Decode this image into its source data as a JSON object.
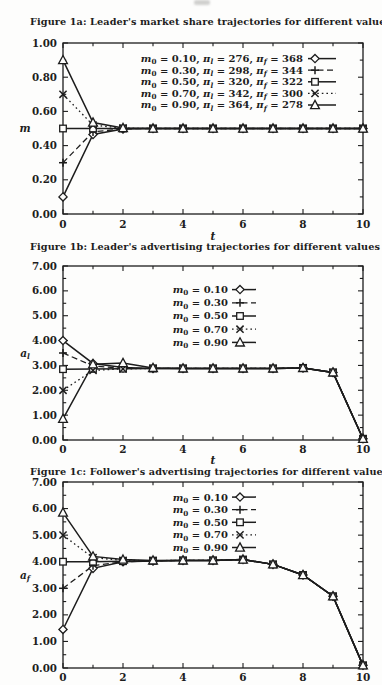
{
  "page": {
    "background": "#fdfdfc",
    "ink": "#1d1d1d",
    "description_markers": {
      "diamond": "open-diamond-marker",
      "plus": "plus-marker",
      "square": "open-square-marker",
      "x": "x-marker",
      "triangle": "open-triangle-marker"
    }
  },
  "chart_data": [
    {
      "type": "line",
      "id": "figure-1a",
      "title": "Figure 1a: Leader's market share trajectories for different values of m_0",
      "xlabel": "t",
      "ylabel": "m",
      "xlim": [
        0,
        10
      ],
      "ylim": [
        0.0,
        1.0
      ],
      "xticks": [
        0,
        2,
        4,
        6,
        8,
        10
      ],
      "xticks_minor": [
        1,
        3,
        5,
        7,
        9
      ],
      "yticks": [
        0.0,
        0.2,
        0.4,
        0.6,
        0.8,
        1.0
      ],
      "ytick_minor_step": 0.1,
      "grid": false,
      "legend_position": "inside-top-center",
      "x": [
        0,
        1,
        2,
        3,
        4,
        5,
        6,
        7,
        8,
        9,
        10
      ],
      "series": [
        {
          "name": "m_0 = 0.10, π_l = 276, π_f = 368",
          "marker": "diamond",
          "line": "solid",
          "values": [
            0.1,
            0.465,
            0.497,
            0.5,
            0.5,
            0.5,
            0.5,
            0.5,
            0.5,
            0.5,
            0.5
          ]
        },
        {
          "name": "m_0 = 0.30, π_l = 298, π_f = 344",
          "marker": "plus",
          "line": "dashed",
          "values": [
            0.3,
            0.48,
            0.498,
            0.5,
            0.5,
            0.5,
            0.5,
            0.5,
            0.5,
            0.5,
            0.5
          ]
        },
        {
          "name": "m_0 = 0.50, π_l = 320, π_f = 322",
          "marker": "square",
          "line": "solid",
          "values": [
            0.5,
            0.5,
            0.5,
            0.5,
            0.5,
            0.5,
            0.5,
            0.5,
            0.5,
            0.5,
            0.5
          ]
        },
        {
          "name": "m_0 = 0.70, π_l = 342, π_f = 300",
          "marker": "x",
          "line": "dotted",
          "values": [
            0.7,
            0.52,
            0.502,
            0.5,
            0.5,
            0.5,
            0.5,
            0.5,
            0.5,
            0.5,
            0.5
          ]
        },
        {
          "name": "m_0 = 0.90, π_l = 364, π_f = 278",
          "marker": "triangle",
          "line": "solid",
          "values": [
            0.9,
            0.535,
            0.503,
            0.5,
            0.5,
            0.5,
            0.5,
            0.5,
            0.5,
            0.5,
            0.5
          ]
        }
      ]
    },
    {
      "type": "line",
      "id": "figure-1b",
      "title": "Figure 1b: Leader's advertising trajectories for different values of m_0",
      "xlabel": "t",
      "ylabel": "a_l",
      "xlim": [
        0,
        10
      ],
      "ylim": [
        0.0,
        7.0
      ],
      "xticks": [
        0,
        2,
        4,
        6,
        8,
        10
      ],
      "xticks_minor": [
        1,
        3,
        5,
        7,
        9
      ],
      "yticks": [
        0.0,
        1.0,
        2.0,
        3.0,
        4.0,
        5.0,
        6.0,
        7.0
      ],
      "ytick_minor_step": 0.5,
      "grid": false,
      "legend_position": "inside-top-center",
      "x": [
        0,
        1,
        2,
        3,
        4,
        5,
        6,
        7,
        8,
        9,
        10
      ],
      "series": [
        {
          "name": "m_0 = 0.10",
          "marker": "diamond",
          "line": "solid",
          "values": [
            4.0,
            3.08,
            2.92,
            2.88,
            2.88,
            2.88,
            2.88,
            2.88,
            2.9,
            2.72,
            0.05
          ]
        },
        {
          "name": "m_0 = 0.30",
          "marker": "plus",
          "line": "dashed",
          "values": [
            3.5,
            2.98,
            2.88,
            2.88,
            2.88,
            2.88,
            2.88,
            2.88,
            2.9,
            2.72,
            0.05
          ]
        },
        {
          "name": "m_0 = 0.50",
          "marker": "square",
          "line": "solid",
          "values": [
            2.85,
            2.86,
            2.87,
            2.88,
            2.88,
            2.88,
            2.88,
            2.88,
            2.9,
            2.72,
            0.05
          ]
        },
        {
          "name": "m_0 = 0.70",
          "marker": "x",
          "line": "dotted",
          "values": [
            2.0,
            2.8,
            2.86,
            2.88,
            2.88,
            2.88,
            2.88,
            2.88,
            2.9,
            2.72,
            0.05
          ]
        },
        {
          "name": "m_0 = 0.90",
          "marker": "triangle",
          "line": "solid",
          "values": [
            0.85,
            3.05,
            3.1,
            2.9,
            2.88,
            2.88,
            2.88,
            2.88,
            2.9,
            2.72,
            0.05
          ]
        }
      ]
    },
    {
      "type": "line",
      "id": "figure-1c",
      "title": "Figure 1c: Follower's advertising trajectories for different values of m_0",
      "xlabel": "",
      "ylabel": "a_f",
      "xlim": [
        0,
        10
      ],
      "ylim": [
        0.0,
        7.0
      ],
      "xticks": [
        0,
        2,
        4,
        6,
        8,
        10
      ],
      "xticks_minor": [
        1,
        3,
        5,
        7,
        9
      ],
      "yticks": [
        0.0,
        1.0,
        2.0,
        3.0,
        4.0,
        5.0,
        6.0,
        7.0
      ],
      "ytick_minor_step": 0.5,
      "grid": false,
      "legend_position": "inside-top-center",
      "x": [
        0,
        1,
        2,
        3,
        4,
        5,
        6,
        7,
        8,
        9,
        10
      ],
      "series": [
        {
          "name": "m_0 = 0.10",
          "marker": "diamond",
          "line": "solid",
          "values": [
            1.45,
            3.75,
            4.0,
            4.03,
            4.05,
            4.05,
            4.08,
            3.9,
            3.5,
            2.7,
            0.1
          ]
        },
        {
          "name": "m_0 = 0.30",
          "marker": "plus",
          "line": "dashed",
          "values": [
            3.0,
            3.85,
            4.0,
            4.03,
            4.05,
            4.05,
            4.08,
            3.9,
            3.5,
            2.7,
            0.1
          ]
        },
        {
          "name": "m_0 = 0.50",
          "marker": "square",
          "line": "solid",
          "values": [
            4.0,
            4.0,
            4.02,
            4.04,
            4.05,
            4.05,
            4.08,
            3.9,
            3.5,
            2.7,
            0.1
          ]
        },
        {
          "name": "m_0 = 0.70",
          "marker": "x",
          "line": "dotted",
          "values": [
            5.0,
            4.15,
            4.05,
            4.04,
            4.05,
            4.05,
            4.08,
            3.9,
            3.5,
            2.7,
            0.1
          ]
        },
        {
          "name": "m_0 = 0.90",
          "marker": "triangle",
          "line": "solid",
          "values": [
            5.85,
            4.2,
            4.08,
            4.05,
            4.05,
            4.05,
            4.08,
            3.9,
            3.5,
            2.7,
            0.1
          ]
        }
      ]
    }
  ]
}
